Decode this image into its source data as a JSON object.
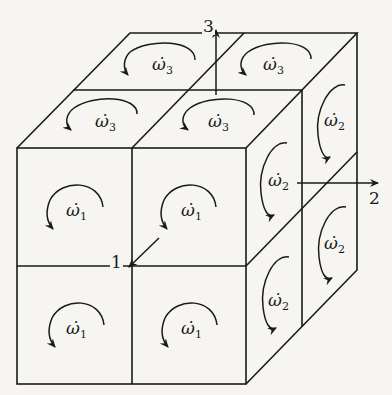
{
  "diagram": {
    "axes": [
      {
        "id": "1",
        "label": "1"
      },
      {
        "id": "2",
        "label": "2"
      },
      {
        "id": "3",
        "label": "3"
      }
    ],
    "front_face_labels": [
      {
        "symbol": "ω̇",
        "sub": "1"
      },
      {
        "symbol": "ω̇",
        "sub": "1"
      },
      {
        "symbol": "ω̇",
        "sub": "1"
      },
      {
        "symbol": "ω̇",
        "sub": "1"
      }
    ],
    "top_face_labels": [
      {
        "symbol": "ω̇",
        "sub": "3"
      },
      {
        "symbol": "ω̇",
        "sub": "3"
      },
      {
        "symbol": "ω̇",
        "sub": "3"
      },
      {
        "symbol": "ω̇",
        "sub": "3"
      }
    ],
    "side_face_labels": [
      {
        "symbol": "ω̇",
        "sub": "2"
      },
      {
        "symbol": "ω̇",
        "sub": "2"
      },
      {
        "symbol": "ω̇",
        "sub": "2"
      },
      {
        "symbol": "ω̇",
        "sub": "2"
      }
    ]
  }
}
